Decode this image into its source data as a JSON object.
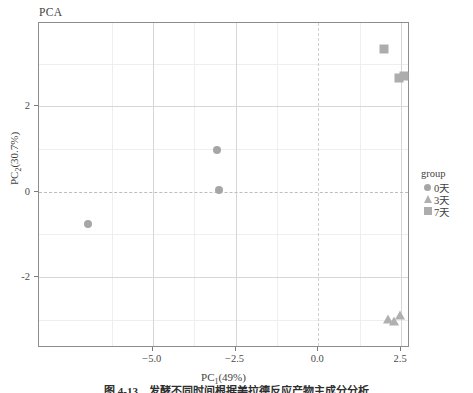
{
  "chart_data": {
    "type": "scatter",
    "title": "PCA",
    "xlabel": "PC₁(49%)",
    "xlabel_base": "PC",
    "xlabel_sub": "1",
    "xlabel_tail": "(49%)",
    "ylabel": "PC₂(30.7%)",
    "ylabel_base": "PC",
    "ylabel_sub": "2",
    "ylabel_tail": "(30.7%)",
    "xlim": [
      -8.44,
      2.77
    ],
    "ylim": [
      -3.66,
      3.95
    ],
    "xticks": [
      -5.0,
      -2.5,
      0.0,
      2.5
    ],
    "xtick_labels": [
      "−5.0",
      "−2.5",
      "0.0",
      "2.5"
    ],
    "yticks": [
      2,
      0,
      -2
    ],
    "ytick_labels": [
      "2",
      "0",
      "-2"
    ],
    "grid": true,
    "grid_major_color": "#d6d6d6",
    "grid_minor_color": "#eeeeee",
    "zero_line_color": "#bdbdbd",
    "legend_position": "right",
    "legend_title": "group",
    "series": [
      {
        "name": "0天",
        "marker": "circle",
        "color": "#a6a6a6",
        "points": [
          {
            "x": -6.96,
            "y": -0.76
          },
          {
            "x": -3.07,
            "y": 0.97
          },
          {
            "x": -2.99,
            "y": 0.04
          }
        ]
      },
      {
        "name": "3天",
        "marker": "triangle",
        "color": "#b0b0b0",
        "points": [
          {
            "x": 2.11,
            "y": -2.98
          },
          {
            "x": 2.3,
            "y": -3.02
          },
          {
            "x": 2.46,
            "y": -2.88
          }
        ]
      },
      {
        "name": "7天",
        "marker": "square",
        "color": "#adadad",
        "points": [
          {
            "x": 1.99,
            "y": 3.35
          },
          {
            "x": 2.45,
            "y": 2.66
          },
          {
            "x": 2.6,
            "y": 2.72
          }
        ]
      }
    ]
  },
  "legend": {
    "title": "group",
    "items": [
      {
        "label": "0天",
        "marker": "circle"
      },
      {
        "label": "3天",
        "marker": "triangle"
      },
      {
        "label": "7天",
        "marker": "square"
      }
    ]
  },
  "caption": {
    "text": "图 4-13　发酵不同时间根据美拉德反应产物主成分分析"
  }
}
